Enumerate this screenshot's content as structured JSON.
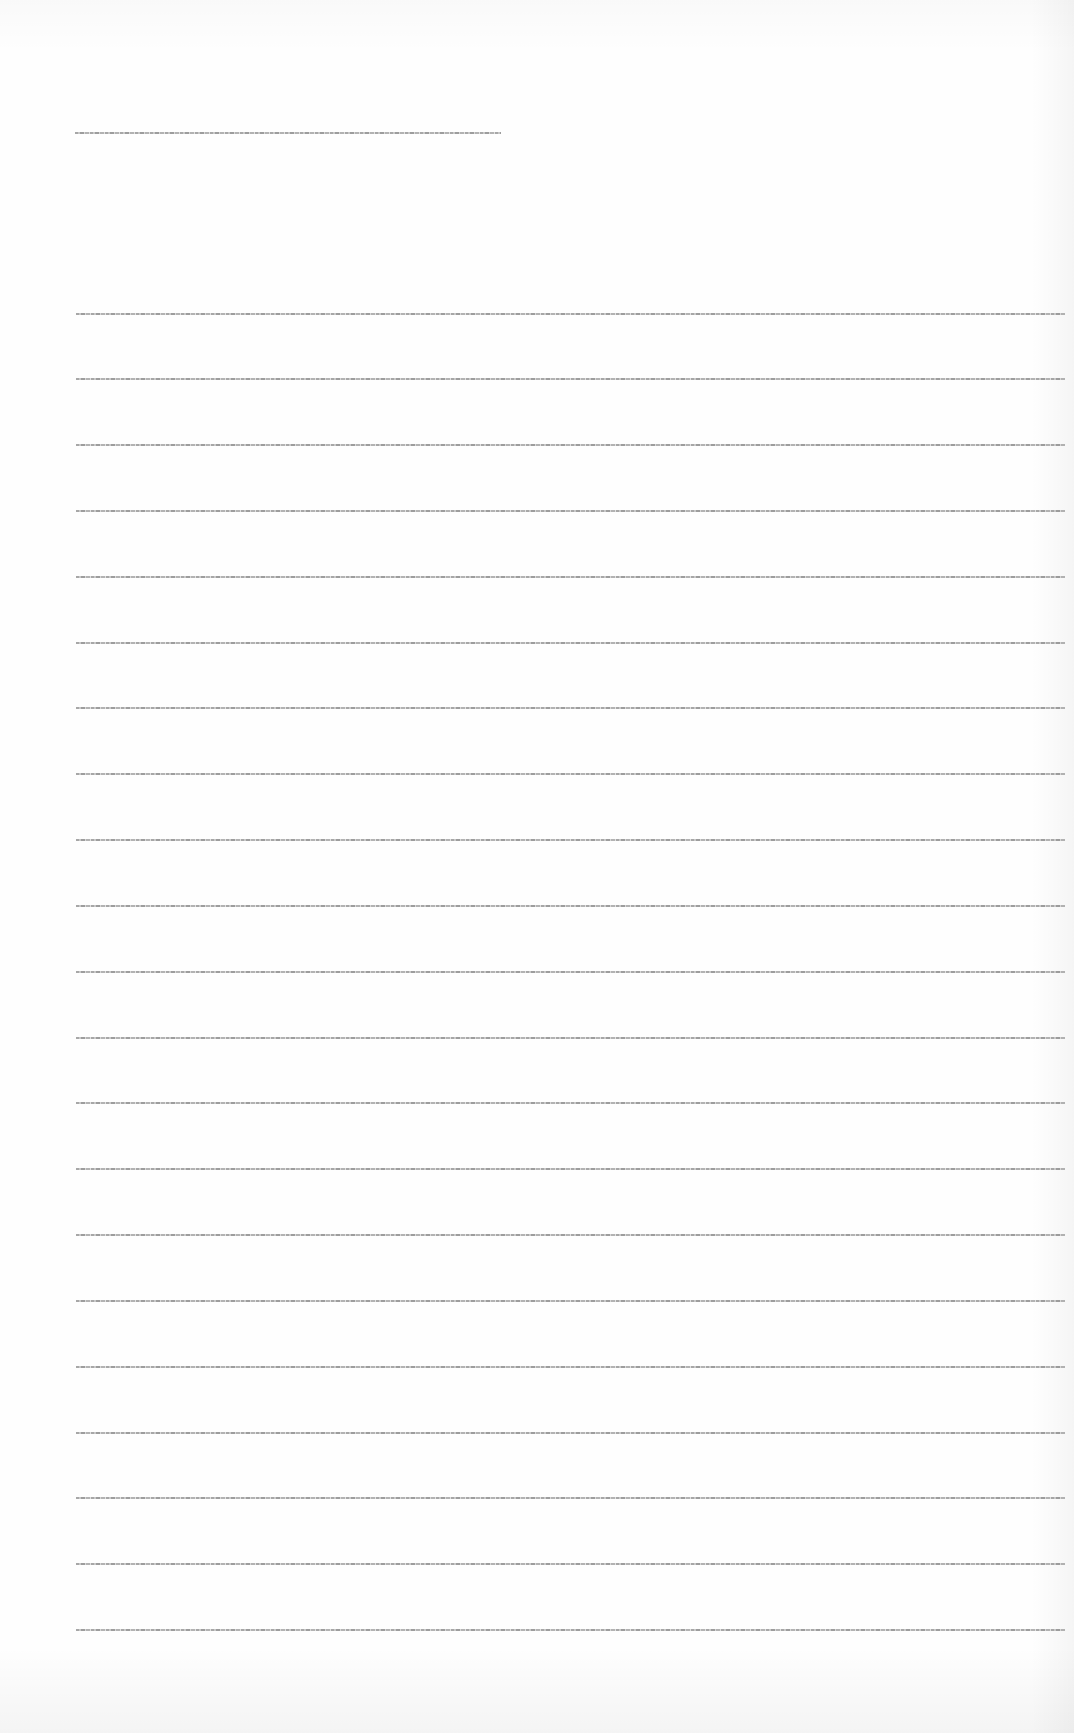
{
  "document": {
    "heading": {
      "text": "",
      "legible": false
    },
    "body_lines": [
      {
        "index": 1,
        "text": "",
        "legible": false
      },
      {
        "index": 2,
        "text": "",
        "legible": false
      },
      {
        "index": 3,
        "text": "",
        "legible": false
      },
      {
        "index": 4,
        "text": "",
        "legible": false
      },
      {
        "index": 5,
        "text": "",
        "legible": false
      },
      {
        "index": 6,
        "text": "",
        "legible": false
      },
      {
        "index": 7,
        "text": "",
        "legible": false
      },
      {
        "index": 8,
        "text": "",
        "legible": false
      },
      {
        "index": 9,
        "text": "",
        "legible": false
      },
      {
        "index": 10,
        "text": "",
        "legible": false
      },
      {
        "index": 11,
        "text": "",
        "legible": false
      },
      {
        "index": 12,
        "text": "",
        "legible": false
      },
      {
        "index": 13,
        "text": "",
        "legible": false
      },
      {
        "index": 14,
        "text": "",
        "legible": false
      },
      {
        "index": 15,
        "text": "",
        "legible": false
      },
      {
        "index": 16,
        "text": "",
        "legible": false
      },
      {
        "index": 17,
        "text": "",
        "legible": false
      },
      {
        "index": 18,
        "text": "",
        "legible": false
      },
      {
        "index": 19,
        "text": "",
        "legible": false
      },
      {
        "index": 20,
        "text": "",
        "legible": false
      },
      {
        "index": 21,
        "text": "",
        "legible": false
      }
    ]
  },
  "colors": {
    "page_background": "#fefefe",
    "text_ink": "#8a8a8a"
  }
}
